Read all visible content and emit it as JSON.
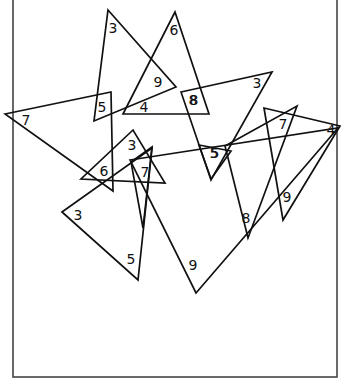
{
  "diagram": {
    "title": "",
    "frame": {
      "x": 13,
      "y": 0,
      "width": 324,
      "height": 377,
      "stroke": "#444444"
    },
    "stroke_color": "#111111",
    "triangles": [
      {
        "id": "t1",
        "points": [
          [
            108,
            10
          ],
          [
            176,
            87
          ],
          [
            94,
            121
          ]
        ],
        "labels": [
          {
            "text": "3",
            "x": 113,
            "y": 28
          },
          {
            "text": "9",
            "x": 158,
            "y": 82
          },
          {
            "text": "5",
            "x": 102,
            "y": 107
          }
        ]
      },
      {
        "id": "t2",
        "points": [
          [
            175,
            12
          ],
          [
            123,
            114
          ],
          [
            209,
            114
          ]
        ],
        "labels": [
          {
            "text": "6",
            "x": 174,
            "y": 30
          },
          {
            "text": "4",
            "x": 144,
            "y": 107
          },
          {
            "text": "8",
            "x": 194,
            "y": 100
          }
        ]
      },
      {
        "id": "t3",
        "points": [
          [
            5,
            114
          ],
          [
            111,
            92
          ],
          [
            113,
            191
          ]
        ],
        "labels": [
          {
            "text": "7",
            "x": 26,
            "y": 120
          }
        ]
      },
      {
        "id": "t4",
        "points": [
          [
            181,
            92
          ],
          [
            272,
            72
          ],
          [
            211,
            180
          ]
        ],
        "labels": [
          {
            "text": "3",
            "x": 257,
            "y": 83
          },
          {
            "text": "8",
            "x": 193,
            "y": 100
          }
        ]
      },
      {
        "id": "t5",
        "points": [
          [
            133,
            130
          ],
          [
            81,
            179
          ],
          [
            165,
            183
          ]
        ],
        "labels": [
          {
            "text": "3",
            "x": 132,
            "y": 145
          },
          {
            "text": "6",
            "x": 104,
            "y": 171
          }
        ]
      },
      {
        "id": "t6",
        "points": [
          [
            152,
            147
          ],
          [
            131,
            162
          ],
          [
            143,
            228
          ]
        ],
        "labels": [
          {
            "text": "7",
            "x": 145,
            "y": 172
          }
        ]
      },
      {
        "id": "t7",
        "points": [
          [
            62,
            212
          ],
          [
            152,
            148
          ],
          [
            138,
            280
          ]
        ],
        "labels": [
          {
            "text": "3",
            "x": 78,
            "y": 215
          },
          {
            "text": "5",
            "x": 131,
            "y": 259
          }
        ]
      },
      {
        "id": "t8",
        "points": [
          [
            130,
            160
          ],
          [
            338,
            128
          ],
          [
            196,
            293
          ]
        ],
        "labels": [
          {
            "text": "9",
            "x": 193,
            "y": 265
          }
        ]
      },
      {
        "id": "t9",
        "points": [
          [
            225,
            146
          ],
          [
            297,
            106
          ],
          [
            248,
            238
          ]
        ],
        "labels": [
          {
            "text": "5",
            "x": 214,
            "y": 153
          },
          {
            "text": "8",
            "x": 246,
            "y": 218
          }
        ]
      },
      {
        "id": "t10",
        "points": [
          [
            264,
            108
          ],
          [
            340,
            126
          ],
          [
            283,
            220
          ]
        ],
        "labels": [
          {
            "text": "7",
            "x": 283,
            "y": 124
          },
          {
            "text": "4",
            "x": 331,
            "y": 130
          },
          {
            "text": "9",
            "x": 287,
            "y": 197
          }
        ]
      },
      {
        "id": "t11",
        "points": [
          [
            199,
            145
          ],
          [
            231,
            151
          ],
          [
            211,
            179
          ]
        ],
        "labels": [
          {
            "text": "5",
            "x": 215,
            "y": 153
          }
        ]
      }
    ]
  }
}
